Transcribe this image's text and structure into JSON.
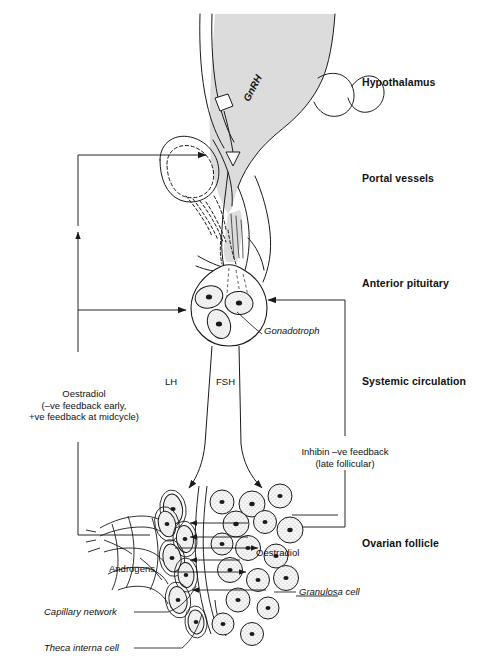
{
  "figure": {
    "background_color": "#ffffff",
    "ink_color": "#1a1a1a",
    "shade_color": "#dcdcdc",
    "width": 478,
    "height": 670
  },
  "headings": [
    {
      "id": "hypothalamus",
      "label": "Hypothalamus",
      "x": 362,
      "y": 82
    },
    {
      "id": "portal-vessels",
      "label": "Portal vessels",
      "x": 362,
      "y": 178
    },
    {
      "id": "anterior-pituitary",
      "label": "Anterior pituitary",
      "x": 362,
      "y": 283
    },
    {
      "id": "systemic-circulation",
      "label": "Systemic circulation",
      "x": 362,
      "y": 381
    },
    {
      "id": "ovarian-follicle",
      "label": "Ovarian follicle",
      "x": 362,
      "y": 543
    }
  ],
  "hormones": {
    "gnrh": "GnRH",
    "lh": "LH",
    "fsh": "FSH"
  },
  "annotations": {
    "oestradiol_feedback": {
      "line1": "Oestradiol",
      "line2": "(–ve feedback early,",
      "line3": "+ve feedback at midcycle)"
    },
    "inhibin_feedback": {
      "line1": "Inhibin –ve feedback",
      "line2": "(late follicular)"
    },
    "androgens": "Androgens",
    "oestradiol": "Oestradiol"
  },
  "leader_labels": [
    {
      "id": "gonadotroph",
      "label": "Gonadotroph",
      "x": 240,
      "y": 330
    },
    {
      "id": "granulosa-cell",
      "label": "Granulosa cell",
      "x": 300,
      "y": 591
    },
    {
      "id": "capillary-network",
      "label": "Capillary network",
      "x": 44,
      "y": 612
    },
    {
      "id": "theca-interna-cell",
      "label": "Theca interna cell",
      "x": 44,
      "y": 648
    }
  ],
  "icons": {
    "arrow": "arrow-head",
    "neuron": "neuron-terminal-icon",
    "cell": "cell-icon"
  }
}
